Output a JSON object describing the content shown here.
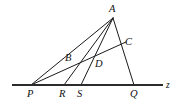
{
  "figure": {
    "kind": "geometry-diagram",
    "background_color": "#ffffff",
    "stroke_color": "#1a1a1a",
    "axis_color": "#2b2b2b",
    "axis_name": "z",
    "labels": {
      "A": "A",
      "B": "B",
      "C": "C",
      "D": "D",
      "P": "P",
      "Q": "Q",
      "R": "R",
      "S": "S",
      "z": "z"
    },
    "points": [
      {
        "id": "A",
        "label": "A",
        "x": 113,
        "y": 18,
        "label_x": 109,
        "label_y": 4
      },
      {
        "id": "B",
        "label": "B",
        "x": 76,
        "y": 61,
        "label_x": 65,
        "label_y": 53
      },
      {
        "id": "C",
        "label": "C",
        "x": 122,
        "y": 44,
        "label_x": 125,
        "label_y": 37
      },
      {
        "id": "D",
        "label": "D",
        "x": 93,
        "y": 64,
        "label_x": 95,
        "label_y": 59
      },
      {
        "id": "P",
        "label": "P",
        "x": 31,
        "y": 85,
        "label_x": 27,
        "label_y": 89
      },
      {
        "id": "R",
        "label": "R",
        "x": 64,
        "y": 85,
        "label_x": 59,
        "label_y": 89
      },
      {
        "id": "S",
        "label": "S",
        "x": 81,
        "y": 85,
        "label_x": 77,
        "label_y": 89
      },
      {
        "id": "Q",
        "label": "Q",
        "x": 134,
        "y": 85,
        "label_x": 130,
        "label_y": 89
      }
    ],
    "axis": {
      "x1": 12,
      "y1": 85,
      "x2": 163,
      "y2": 85,
      "label_x": 166,
      "label_y": 81
    },
    "segments": [
      {
        "id": "AP",
        "from": "A",
        "to": "P",
        "x1": 113,
        "y1": 18,
        "x2": 31,
        "y2": 85
      },
      {
        "id": "AR",
        "from": "A",
        "to": "R",
        "x1": 113,
        "y1": 18,
        "x2": 64,
        "y2": 85
      },
      {
        "id": "AS",
        "from": "A",
        "to": "S",
        "x1": 113,
        "y1": 18,
        "x2": 81,
        "y2": 85
      },
      {
        "id": "AQ",
        "from": "A",
        "to": "Q",
        "x1": 113,
        "y1": 18,
        "x2": 134,
        "y2": 85
      },
      {
        "id": "PC",
        "from": "P",
        "to": "C",
        "x1": 31,
        "y1": 85,
        "x2": 126,
        "y2": 42
      }
    ]
  }
}
